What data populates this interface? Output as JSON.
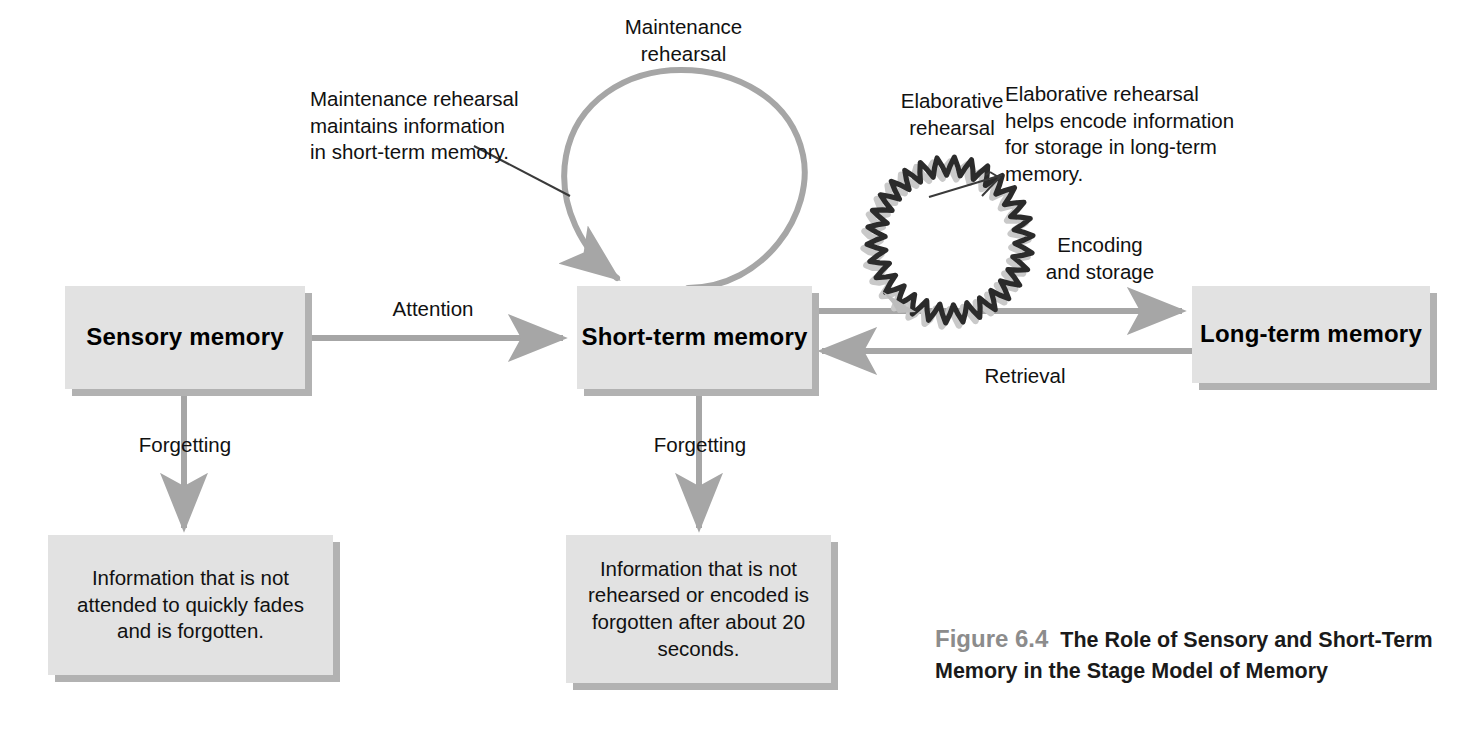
{
  "figure": {
    "number": "Figure 6.4",
    "title": "The Role of Sensory and Short-Term Memory in the Stage Model of Memory"
  },
  "colors": {
    "box_fill": "#e2e2e2",
    "box_shadow": "#b2b2b2",
    "arrow_gray": "#a6a6a6",
    "squiggle_dark": "#2b2b2b",
    "squiggle_light": "#c9c9c9",
    "leader_line": "#3a3a3a",
    "text": "#111111",
    "caption_number": "#8c8c8c"
  },
  "stages": [
    {
      "id": "sensory",
      "label": "Sensory\nmemory"
    },
    {
      "id": "shortterm",
      "label": "Short-term\nmemory"
    },
    {
      "id": "longterm",
      "label": "Long-term\nmemory"
    }
  ],
  "flow_labels": {
    "attention": "Attention",
    "encoding_and_storage": "Encoding\nand storage",
    "retrieval": "Retrieval",
    "forgetting_sensory": "Forgetting",
    "forgetting_shortterm": "Forgetting"
  },
  "rehearsal": {
    "maintenance_loop_label": "Maintenance\nrehearsal",
    "elaborative_loop_label": "Elaborative\nrehearsal"
  },
  "annotations": [
    {
      "id": "maintenance-note",
      "text": "Maintenance rehearsal\nmaintains information\nin short-term memory."
    },
    {
      "id": "elaborative-note",
      "text": "Elaborative rehearsal\nhelps encode information\nfor storage in long-term\nmemory."
    }
  ],
  "outcome_boxes": [
    {
      "id": "sensory-outcome",
      "text": "Information that is not\nattended to quickly\nfades and is forgotten."
    },
    {
      "id": "shortterm-outcome",
      "text": "Information that is not\nrehearsed or encoded\nis forgotten after\nabout 20 seconds."
    }
  ],
  "chart_data": {
    "type": "diagram",
    "title": "The Role of Sensory and Short-Term Memory in the Stage Model of Memory",
    "nodes": [
      {
        "id": "sensory",
        "label": "Sensory memory",
        "x": 65,
        "y": 286,
        "w": 240,
        "h": 103
      },
      {
        "id": "shortterm",
        "label": "Short-term memory",
        "x": 577,
        "y": 286,
        "w": 235,
        "h": 103
      },
      {
        "id": "longterm",
        "label": "Long-term memory",
        "x": 1192,
        "y": 286,
        "w": 238,
        "h": 97
      },
      {
        "id": "sensory-outcome",
        "label": "Information that is not attended to quickly fades and is forgotten.",
        "x": 48,
        "y": 535,
        "w": 285,
        "h": 140
      },
      {
        "id": "shortterm-outcome",
        "label": "Information that is not rehearsed or encoded is forgotten after about 20 seconds.",
        "x": 566,
        "y": 535,
        "w": 265,
        "h": 148
      }
    ],
    "edges": [
      {
        "from": "sensory",
        "to": "shortterm",
        "label": "Attention",
        "direction": "right"
      },
      {
        "from": "shortterm",
        "to": "longterm",
        "label": "Encoding and storage",
        "direction": "right"
      },
      {
        "from": "longterm",
        "to": "shortterm",
        "label": "Retrieval",
        "direction": "left"
      },
      {
        "from": "sensory",
        "to": "sensory-outcome",
        "label": "Forgetting",
        "direction": "down"
      },
      {
        "from": "shortterm",
        "to": "shortterm-outcome",
        "label": "Forgetting",
        "direction": "down"
      },
      {
        "from": "shortterm",
        "to": "shortterm",
        "label": "Maintenance rehearsal",
        "direction": "loop"
      },
      {
        "from": "shortterm",
        "to": "longterm",
        "label": "Elaborative rehearsal",
        "direction": "loop"
      }
    ]
  }
}
